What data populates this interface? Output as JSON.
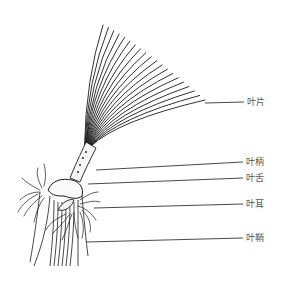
{
  "diagram": {
    "line_color": "#1a1a1a",
    "label_color": "#555555",
    "labels": [
      {
        "id": "blade",
        "text": "叶片",
        "x": 247,
        "y": 97,
        "leader_from": [
          205,
          103
        ],
        "leader_to": [
          244,
          102
        ]
      },
      {
        "id": "petiole",
        "text": "叶柄",
        "x": 246,
        "y": 157,
        "leader_from": [
          96,
          170
        ],
        "leader_to": [
          243,
          162
        ]
      },
      {
        "id": "ligule",
        "text": "叶舌",
        "x": 246,
        "y": 173,
        "leader_from": [
          88,
          184
        ],
        "leader_to": [
          243,
          178
        ]
      },
      {
        "id": "auricle",
        "text": "叶耳",
        "x": 246,
        "y": 199,
        "leader_from": [
          94,
          208
        ],
        "leader_to": [
          243,
          204
        ]
      },
      {
        "id": "sheath",
        "text": "叶鞘",
        "x": 246,
        "y": 233,
        "leader_from": [
          86,
          242
        ],
        "leader_to": [
          243,
          238
        ]
      }
    ]
  }
}
